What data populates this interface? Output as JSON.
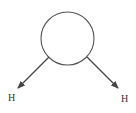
{
  "diagram": {
    "colors": {
      "stroke": "#444444",
      "label": "#333333",
      "background": "#ffffff"
    },
    "center_node": {
      "shape": "circle",
      "cx": 67.5,
      "cy": 38.5,
      "r": 26.5,
      "label": ""
    },
    "bonds": [
      {
        "from": [
          49,
          57
        ],
        "to": [
          18,
          88
        ],
        "arrow": true,
        "label": "H",
        "label_pos": [
          8,
          101
        ]
      },
      {
        "from": [
          87,
          57
        ],
        "to": [
          118,
          88
        ],
        "arrow": true,
        "label": "H",
        "label_pos": [
          121,
          102
        ]
      }
    ],
    "labels": {
      "left_atom": "H",
      "right_atom": "H"
    }
  }
}
